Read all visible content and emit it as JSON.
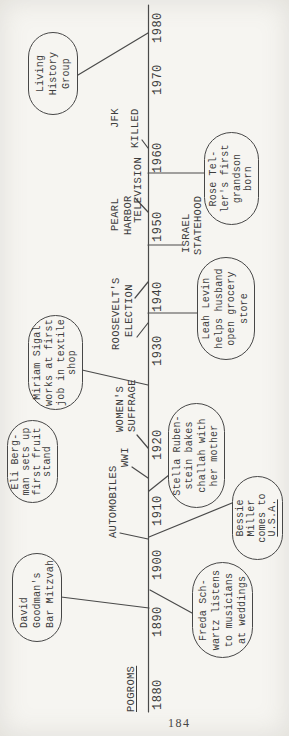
{
  "page": {
    "number": "184"
  },
  "colors": {
    "paper": "#f6f5f1",
    "ink": "#3d3d3d",
    "line": "#4a4a4a"
  },
  "figure": {
    "type": "timeline",
    "axis": {
      "x1": 6,
      "y": 148.5,
      "x2": 713
    },
    "years": [
      {
        "label": "1880",
        "x": 8
      },
      {
        "label": "1890",
        "x": 81
      },
      {
        "label": "1900",
        "x": 138
      },
      {
        "label": "1910",
        "x": 192
      },
      {
        "label": "1920",
        "x": 258
      },
      {
        "label": "1930",
        "x": 352
      },
      {
        "label": "1940",
        "x": 406
      },
      {
        "label": "1950",
        "x": 476
      },
      {
        "label": "1960",
        "x": 545
      },
      {
        "label": "1970",
        "x": 623
      },
      {
        "label": "1980",
        "x": 675
      }
    ],
    "era_labels": [
      {
        "id": "pogroms",
        "text": "POGROMS",
        "x": 6,
        "y": 126,
        "underline": true
      },
      {
        "id": "automobiles",
        "text": "AUTOMOBILES",
        "x": 180,
        "y": 108,
        "underline": false
      },
      {
        "id": "wwi",
        "text": "WWI",
        "x": 251,
        "y": 120,
        "underline": false
      },
      {
        "id": "womens",
        "text": "WOMEN'S",
        "x": 286,
        "y": 115,
        "underline": false
      },
      {
        "id": "suffrage",
        "text": "SUFFRAGE",
        "x": 286,
        "y": 127,
        "underline": false
      },
      {
        "id": "roosevelts",
        "text": "ROOSEVELT'S",
        "x": 368,
        "y": 111,
        "underline": false
      },
      {
        "id": "election",
        "text": "ELECTION",
        "x": 381,
        "y": 124,
        "underline": false
      },
      {
        "id": "pearl",
        "text": "PEARL",
        "x": 487,
        "y": 110,
        "underline": false
      },
      {
        "id": "harbor",
        "text": "HARBOR",
        "x": 483,
        "y": 123,
        "underline": false
      },
      {
        "id": "television",
        "text": "TELEVISION",
        "x": 495,
        "y": 133,
        "underline": false
      },
      {
        "id": "jfk",
        "text": "JFK",
        "x": 590,
        "y": 110,
        "underline": false
      },
      {
        "id": "killed",
        "text": "KILLED",
        "x": 570,
        "y": 130,
        "underline": false
      },
      {
        "id": "israel",
        "text": "ISRAEL",
        "x": 465,
        "y": 181,
        "underline": false
      },
      {
        "id": "statehood",
        "text": "STATEHOOD",
        "x": 463,
        "y": 193,
        "underline": false
      }
    ],
    "connectors": [
      {
        "id": "living-history",
        "x1": 643,
        "y1": 78,
        "x2": 685,
        "y2": 148
      },
      {
        "id": "jfk-killed",
        "x1": 578,
        "y1": 142,
        "x2": 570,
        "y2": 148
      },
      {
        "id": "television",
        "x1": 520,
        "y1": 135,
        "x2": 506,
        "y2": 148
      },
      {
        "id": "roosevelt-a",
        "x1": 420,
        "y1": 135,
        "x2": 436,
        "y2": 148
      },
      {
        "id": "roosevelt-b",
        "x1": 381,
        "y1": 137,
        "x2": 395,
        "y2": 148
      },
      {
        "id": "suffrage",
        "x1": 283,
        "y1": 137,
        "x2": 270,
        "y2": 148
      },
      {
        "id": "wwi",
        "x1": 251,
        "y1": 132,
        "x2": 240,
        "y2": 148
      },
      {
        "id": "automobiles",
        "x1": 185,
        "y1": 120,
        "x2": 179,
        "y2": 148
      },
      {
        "id": "miriam-sigal",
        "x1": 348,
        "y1": 82,
        "x2": 333,
        "y2": 148
      },
      {
        "id": "david-goodman",
        "x1": 121,
        "y1": 61,
        "x2": 110,
        "y2": 149
      },
      {
        "id": "freda-schwartz",
        "x1": 128,
        "y1": 150,
        "x2": 105,
        "y2": 192
      },
      {
        "id": "bessie-miller",
        "x1": 181,
        "y1": 149,
        "x2": 215,
        "y2": 232
      },
      {
        "id": "stella-ruben",
        "x1": 227,
        "y1": 149,
        "x2": 243,
        "y2": 169
      },
      {
        "id": "leah-levin",
        "x1": 405,
        "y1": 148,
        "x2": 405,
        "y2": 197
      },
      {
        "id": "rose-teller",
        "x1": 545,
        "y1": 148,
        "x2": 545,
        "y2": 204
      },
      {
        "id": "israel",
        "x1": 473,
        "y1": 148,
        "x2": 473,
        "y2": 182
      }
    ],
    "bubbles": [
      {
        "id": "living-history-group",
        "x": 603,
        "y": 28,
        "w": 83,
        "h": 50,
        "align": "center",
        "lines": [
          "Living",
          "History",
          "Group"
        ]
      },
      {
        "id": "miriam-sigal",
        "x": 308,
        "y": 28,
        "w": 95,
        "h": 55,
        "align": "center",
        "lines": [
          "Miriam Sigal",
          "works at first",
          "job in textile",
          "shop"
        ]
      },
      {
        "id": "eli-bergman",
        "x": 215,
        "y": 7,
        "w": 83,
        "h": 51,
        "align": "center",
        "lines": [
          "Eli Berg-",
          "man sets up",
          "first fruit",
          "stand"
        ]
      },
      {
        "id": "david-goodman",
        "x": 76,
        "y": 12,
        "w": 89,
        "h": 50,
        "align": "left",
        "lines": [
          "David",
          "Goodman's",
          "Bar Mitzvah"
        ]
      },
      {
        "id": "rose-teller",
        "x": 493,
        "y": 204,
        "w": 93,
        "h": 55,
        "align": "center",
        "lines": [
          "Rose Tel-",
          "ler's first",
          "grandson",
          "born"
        ]
      },
      {
        "id": "leah-levin",
        "x": 358,
        "y": 197,
        "w": 103,
        "h": 58,
        "align": "center",
        "lines": [
          "Leah Levin",
          "helps husband",
          "open grocery",
          "store"
        ]
      },
      {
        "id": "stella-rubenstein",
        "x": 210,
        "y": 168,
        "w": 105,
        "h": 57,
        "align": "center",
        "lines": [
          "Stella Ruben-",
          "stein bakes",
          "challah with",
          "her mother"
        ]
      },
      {
        "id": "bessie-miller",
        "x": 158,
        "y": 232,
        "w": 84,
        "h": 51,
        "align": "center",
        "lines": [
          "Bessie",
          "Miller",
          "comes to",
          "U.S.A."
        ],
        "underline_line": 3
      },
      {
        "id": "freda-schwartz",
        "x": 60,
        "y": 192,
        "w": 96,
        "h": 61,
        "align": "center",
        "lines": [
          "Freda Sch-",
          "wartz listens",
          "to musicians",
          "at weddings"
        ]
      }
    ]
  }
}
